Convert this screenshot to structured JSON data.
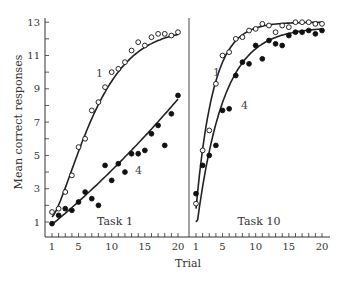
{
  "chart_data": {
    "type": "scatter",
    "title": "",
    "xlabel": "Trial",
    "ylabel": "Mean correct responses",
    "ylim": [
      0,
      13
    ],
    "yticks": [
      1,
      3,
      5,
      7,
      9,
      11,
      13
    ],
    "xticks": [
      1,
      5,
      10,
      15,
      20
    ],
    "xlim": [
      1,
      20
    ],
    "grid": false,
    "legend": "inline labels",
    "panels": [
      {
        "label": "Task 1",
        "series": [
          {
            "name": "1",
            "marker": "open-circle",
            "x": [
              1,
              2,
              3,
              4,
              5,
              6,
              7,
              8,
              9,
              10,
              11,
              12,
              13,
              14,
              15,
              16,
              17,
              18,
              19,
              20
            ],
            "values": [
              1.6,
              1.8,
              2.8,
              3.8,
              5.5,
              6.0,
              7.7,
              8.2,
              9.1,
              10.0,
              10.2,
              10.6,
              11.3,
              11.8,
              11.6,
              12.1,
              12.3,
              12.3,
              12.2,
              12.4
            ]
          },
          {
            "name": "4",
            "marker": "filled-circle",
            "x": [
              1,
              2,
              3,
              4,
              5,
              6,
              7,
              8,
              9,
              10,
              11,
              12,
              13,
              14,
              15,
              16,
              17,
              18,
              19,
              20
            ],
            "values": [
              0.9,
              1.4,
              1.8,
              1.7,
              2.2,
              2.8,
              2.4,
              2.0,
              4.4,
              3.5,
              4.5,
              4.0,
              5.1,
              5.1,
              5.3,
              6.3,
              6.8,
              5.6,
              7.5,
              8.6
            ]
          }
        ]
      },
      {
        "label": "Task 10",
        "series": [
          {
            "name": "1",
            "marker": "open-circle",
            "x": [
              1,
              2,
              3,
              4,
              5,
              6,
              7,
              8,
              9,
              10,
              11,
              12,
              13,
              14,
              15,
              16,
              17,
              18,
              19,
              20
            ],
            "values": [
              2.1,
              5.3,
              6.5,
              9.3,
              11.0,
              11.2,
              12.0,
              12.1,
              12.5,
              12.6,
              12.9,
              12.8,
              12.4,
              12.8,
              12.7,
              13.0,
              13.0,
              13.0,
              12.9,
              12.9
            ]
          },
          {
            "name": "4",
            "marker": "filled-circle",
            "x": [
              1,
              2,
              3,
              4,
              5,
              6,
              7,
              8,
              9,
              10,
              11,
              12,
              13,
              14,
              15,
              16,
              17,
              18,
              19,
              20
            ],
            "values": [
              2.7,
              4.4,
              5.0,
              5.6,
              7.7,
              7.8,
              9.8,
              10.6,
              10.5,
              11.6,
              10.8,
              11.9,
              11.7,
              11.6,
              12.2,
              12.4,
              12.4,
              12.5,
              12.3,
              12.5
            ]
          }
        ]
      }
    ]
  },
  "labels": {
    "ylabel": "Mean correct responses",
    "xlabel": "Trial",
    "panel1": "Task 1",
    "panel2": "Task 10",
    "series1": "1",
    "series4": "4"
  }
}
